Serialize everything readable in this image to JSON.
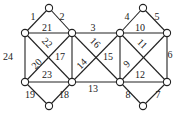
{
  "diagram": {
    "nodes": [
      {
        "id": "A",
        "x": 49,
        "y": 8
      },
      {
        "id": "B",
        "x": 25,
        "y": 33
      },
      {
        "id": "C",
        "x": 72,
        "y": 33
      },
      {
        "id": "D",
        "x": 120,
        "y": 33
      },
      {
        "id": "E",
        "x": 143,
        "y": 8
      },
      {
        "id": "F",
        "x": 167,
        "y": 33
      },
      {
        "id": "G",
        "x": 25,
        "y": 82
      },
      {
        "id": "H",
        "x": 72,
        "y": 82
      },
      {
        "id": "I",
        "x": 120,
        "y": 82
      },
      {
        "id": "J",
        "x": 167,
        "y": 82
      },
      {
        "id": "K",
        "x": 49,
        "y": 106
      },
      {
        "id": "L",
        "x": 143,
        "y": 106
      }
    ],
    "edges": [
      {
        "label": "1",
        "from": "A",
        "to": "B",
        "lx": 33,
        "ly": 20,
        "rot": 0
      },
      {
        "label": "2",
        "from": "A",
        "to": "C",
        "lx": 62,
        "ly": 20,
        "rot": 0
      },
      {
        "label": "3",
        "from": "C",
        "to": "D",
        "lx": 93,
        "ly": 31,
        "rot": 0
      },
      {
        "label": "4",
        "from": "E",
        "to": "D",
        "lx": 127,
        "ly": 20,
        "rot": 0
      },
      {
        "label": "5",
        "from": "E",
        "to": "F",
        "lx": 157,
        "ly": 20,
        "rot": 0
      },
      {
        "label": "6",
        "from": "F",
        "to": "J",
        "lx": 170,
        "ly": 58,
        "rot": 0
      },
      {
        "label": "7",
        "from": "J",
        "to": "L",
        "lx": 158,
        "ly": 98,
        "rot": 0
      },
      {
        "label": "8",
        "from": "I",
        "to": "L",
        "lx": 128,
        "ly": 98,
        "rot": 0
      },
      {
        "label": "9",
        "from": "I",
        "to": "F",
        "lx": 127,
        "ly": 67,
        "rot": -45
      },
      {
        "label": "10",
        "from": "D",
        "to": "F",
        "lx": 140,
        "ly": 31,
        "rot": 0
      },
      {
        "label": "11",
        "from": "D",
        "to": "J",
        "lx": 142,
        "ly": 47,
        "rot": 45
      },
      {
        "label": "12",
        "from": "I",
        "to": "J",
        "lx": 140,
        "ly": 78,
        "rot": 0
      },
      {
        "label": "13",
        "from": "H",
        "to": "I",
        "lx": 93,
        "ly": 92,
        "rot": 0
      },
      {
        "label": "14",
        "from": "H",
        "to": "D",
        "lx": 82,
        "ly": 67,
        "rot": -45
      },
      {
        "label": "15",
        "from": "D",
        "to": "I",
        "lx": 108,
        "ly": 60,
        "rot": 0
      },
      {
        "label": "16",
        "from": "C",
        "to": "I",
        "lx": 95,
        "ly": 46,
        "rot": 45
      },
      {
        "label": "17",
        "from": "C",
        "to": "H",
        "lx": 60,
        "ly": 60,
        "rot": 0
      },
      {
        "label": "18",
        "from": "H",
        "to": "K",
        "lx": 64,
        "ly": 98,
        "rot": 0
      },
      {
        "label": "19",
        "from": "G",
        "to": "K",
        "lx": 30,
        "ly": 98,
        "rot": 0
      },
      {
        "label": "20",
        "from": "G",
        "to": "C",
        "lx": 37,
        "ly": 67,
        "rot": -45
      },
      {
        "label": "21",
        "from": "B",
        "to": "C",
        "lx": 47,
        "ly": 31,
        "rot": 0
      },
      {
        "label": "22",
        "from": "B",
        "to": "H",
        "lx": 47,
        "ly": 46,
        "rot": 45
      },
      {
        "label": "23",
        "from": "G",
        "to": "H",
        "lx": 47,
        "ly": 78,
        "rot": 0
      },
      {
        "label": "24",
        "from": "B",
        "to": "G",
        "lx": 8,
        "ly": 60,
        "rot": 0
      }
    ]
  }
}
